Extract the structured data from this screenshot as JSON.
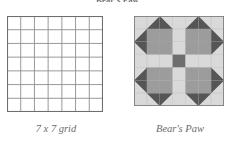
{
  "figure": {
    "title": "Bear's Paw",
    "background_color": "#ffffff"
  },
  "panels": [
    {
      "id": "grid",
      "caption": "7 x 7 grid",
      "type": "empty-grid",
      "rows": 7,
      "cols": 7,
      "x": 7,
      "y": 16,
      "size": 96,
      "cell_size": 13.714,
      "line_color": "#8d8d8d",
      "border_color": "#6e6e6e",
      "fill_color": "#ffffff"
    },
    {
      "id": "quilt",
      "caption": "Bear's Paw",
      "type": "quilt-block",
      "rows": 7,
      "cols": 7,
      "x": 134,
      "y": 16,
      "size": 90,
      "cell_size": 12.857,
      "line_color": "#9b9b9b",
      "border_color": "#7a7a7a"
    }
  ],
  "palette": {
    "light": "#d9d9d9",
    "light_alt": "#e2e2e2",
    "medium": "#9c9c9c",
    "dark": "#555555",
    "center_dark": "#6e6e6e",
    "grid_line": "#9b9b9b"
  },
  "quilt_legend": [
    {
      "key": "light",
      "label": "background / sashing",
      "color": "#d9d9d9"
    },
    {
      "key": "medium",
      "label": "paw pad",
      "color": "#9c9c9c"
    },
    {
      "key": "dark",
      "label": "claw triangle",
      "color": "#555555"
    },
    {
      "key": "center",
      "label": "center square",
      "color": "#6e6e6e"
    }
  ],
  "quilt_cells": [
    [
      {
        "r": 0,
        "c": 0,
        "kind": "solid",
        "fill": "light"
      },
      {
        "r": 0,
        "c": 1,
        "kind": "hst",
        "fill": "light",
        "tri": "dark",
        "corner": "br"
      },
      {
        "r": 0,
        "c": 2,
        "kind": "hst",
        "fill": "light",
        "tri": "dark",
        "corner": "bl"
      },
      {
        "r": 0,
        "c": 3,
        "kind": "solid",
        "fill": "light"
      },
      {
        "r": 0,
        "c": 4,
        "kind": "hst",
        "fill": "light",
        "tri": "dark",
        "corner": "br"
      },
      {
        "r": 0,
        "c": 5,
        "kind": "hst",
        "fill": "light",
        "tri": "dark",
        "corner": "bl"
      },
      {
        "r": 0,
        "c": 6,
        "kind": "solid",
        "fill": "light"
      }
    ],
    [
      {
        "r": 1,
        "c": 0,
        "kind": "hst",
        "fill": "light",
        "tri": "dark",
        "corner": "br"
      },
      {
        "r": 1,
        "c": 1,
        "kind": "solid",
        "fill": "medium"
      },
      {
        "r": 1,
        "c": 2,
        "kind": "solid",
        "fill": "medium"
      },
      {
        "r": 1,
        "c": 3,
        "kind": "solid",
        "fill": "light"
      },
      {
        "r": 1,
        "c": 4,
        "kind": "solid",
        "fill": "medium"
      },
      {
        "r": 1,
        "c": 5,
        "kind": "solid",
        "fill": "medium"
      },
      {
        "r": 1,
        "c": 6,
        "kind": "hst",
        "fill": "light",
        "tri": "dark",
        "corner": "bl"
      }
    ],
    [
      {
        "r": 2,
        "c": 0,
        "kind": "hst",
        "fill": "light",
        "tri": "dark",
        "corner": "tr"
      },
      {
        "r": 2,
        "c": 1,
        "kind": "solid",
        "fill": "medium"
      },
      {
        "r": 2,
        "c": 2,
        "kind": "solid",
        "fill": "medium"
      },
      {
        "r": 2,
        "c": 3,
        "kind": "solid",
        "fill": "light"
      },
      {
        "r": 2,
        "c": 4,
        "kind": "solid",
        "fill": "medium"
      },
      {
        "r": 2,
        "c": 5,
        "kind": "solid",
        "fill": "medium"
      },
      {
        "r": 2,
        "c": 6,
        "kind": "hst",
        "fill": "light",
        "tri": "dark",
        "corner": "tl"
      }
    ],
    [
      {
        "r": 3,
        "c": 0,
        "kind": "solid",
        "fill": "light"
      },
      {
        "r": 3,
        "c": 1,
        "kind": "solid",
        "fill": "light"
      },
      {
        "r": 3,
        "c": 2,
        "kind": "solid",
        "fill": "light"
      },
      {
        "r": 3,
        "c": 3,
        "kind": "solid",
        "fill": "center"
      },
      {
        "r": 3,
        "c": 4,
        "kind": "solid",
        "fill": "light"
      },
      {
        "r": 3,
        "c": 5,
        "kind": "solid",
        "fill": "light"
      },
      {
        "r": 3,
        "c": 6,
        "kind": "solid",
        "fill": "light"
      }
    ],
    [
      {
        "r": 4,
        "c": 0,
        "kind": "hst",
        "fill": "light",
        "tri": "dark",
        "corner": "br"
      },
      {
        "r": 4,
        "c": 1,
        "kind": "solid",
        "fill": "medium"
      },
      {
        "r": 4,
        "c": 2,
        "kind": "solid",
        "fill": "medium"
      },
      {
        "r": 4,
        "c": 3,
        "kind": "solid",
        "fill": "light"
      },
      {
        "r": 4,
        "c": 4,
        "kind": "solid",
        "fill": "medium"
      },
      {
        "r": 4,
        "c": 5,
        "kind": "solid",
        "fill": "medium"
      },
      {
        "r": 4,
        "c": 6,
        "kind": "hst",
        "fill": "light",
        "tri": "dark",
        "corner": "bl"
      }
    ],
    [
      {
        "r": 5,
        "c": 0,
        "kind": "hst",
        "fill": "light",
        "tri": "dark",
        "corner": "tr"
      },
      {
        "r": 5,
        "c": 1,
        "kind": "solid",
        "fill": "medium"
      },
      {
        "r": 5,
        "c": 2,
        "kind": "solid",
        "fill": "medium"
      },
      {
        "r": 5,
        "c": 3,
        "kind": "solid",
        "fill": "light"
      },
      {
        "r": 5,
        "c": 4,
        "kind": "solid",
        "fill": "medium"
      },
      {
        "r": 5,
        "c": 5,
        "kind": "solid",
        "fill": "medium"
      },
      {
        "r": 5,
        "c": 6,
        "kind": "hst",
        "fill": "light",
        "tri": "dark",
        "corner": "tl"
      }
    ],
    [
      {
        "r": 6,
        "c": 0,
        "kind": "solid",
        "fill": "light"
      },
      {
        "r": 6,
        "c": 1,
        "kind": "hst",
        "fill": "light",
        "tri": "dark",
        "corner": "tr"
      },
      {
        "r": 6,
        "c": 2,
        "kind": "hst",
        "fill": "light",
        "tri": "dark",
        "corner": "tl"
      },
      {
        "r": 6,
        "c": 3,
        "kind": "solid",
        "fill": "light"
      },
      {
        "r": 6,
        "c": 4,
        "kind": "hst",
        "fill": "light",
        "tri": "dark",
        "corner": "tr"
      },
      {
        "r": 6,
        "c": 5,
        "kind": "hst",
        "fill": "light",
        "tri": "dark",
        "corner": "tl"
      },
      {
        "r": 6,
        "c": 6,
        "kind": "solid",
        "fill": "light"
      }
    ]
  ]
}
